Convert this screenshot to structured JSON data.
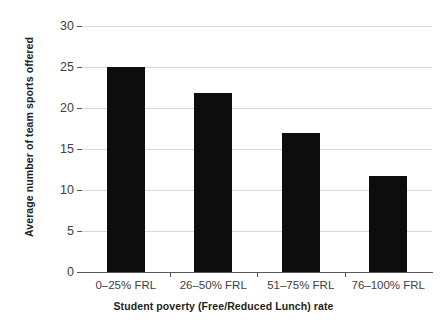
{
  "chart_data": {
    "type": "bar",
    "title": "",
    "subtitle": "",
    "categories": [
      "0–25% FRL",
      "26–50% FRL",
      "51–75% FRL",
      "76–100% FRL"
    ],
    "values": [
      25.0,
      21.8,
      17.0,
      11.7
    ],
    "xlabel": "Student poverty (Free/Reduced Lunch) rate",
    "ylabel": "Average number of team sports offered",
    "ylim": [
      0,
      30
    ],
    "yticks": [
      0,
      5,
      10,
      15,
      20,
      25,
      30
    ],
    "ytick_labels": [
      "0",
      "5",
      "10",
      "15",
      "20",
      "25",
      "30"
    ],
    "grid": "horizontal",
    "legend": "none",
    "bar_color": "#0d0d0d",
    "gridline_color": "#d9d9d9",
    "axis_color": "#58595b",
    "background_color": "#ffffff",
    "annotations": []
  }
}
